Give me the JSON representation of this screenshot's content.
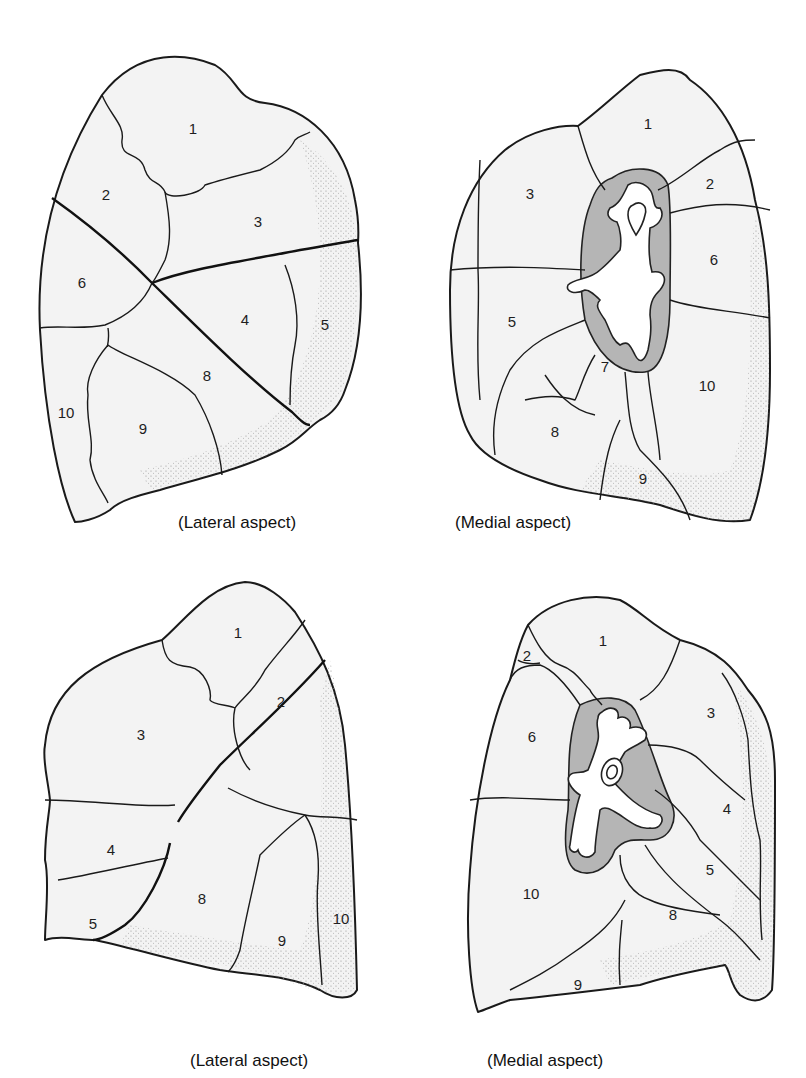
{
  "figure": {
    "panels": [
      {
        "id": "right-lateral",
        "caption": "(Lateral aspect)",
        "segments": [
          "1",
          "2",
          "3",
          "4",
          "5",
          "6",
          "8",
          "9",
          "10"
        ]
      },
      {
        "id": "right-medial",
        "caption": "(Medial aspect)",
        "segments": [
          "1",
          "2",
          "3",
          "5",
          "6",
          "7",
          "8",
          "9",
          "10"
        ]
      },
      {
        "id": "left-lateral",
        "caption": "(Lateral aspect)",
        "segments": [
          "1",
          "2",
          "3",
          "4",
          "5",
          "8",
          "9",
          "10"
        ]
      },
      {
        "id": "left-medial",
        "caption": "(Medial aspect)",
        "segments": [
          "1",
          "2",
          "3",
          "4",
          "5",
          "6",
          "8",
          "9",
          "10"
        ]
      }
    ]
  },
  "colors": {
    "lung_fill": "#f3f3f3",
    "hilum_fill": "#b5b5b5",
    "line": "#1a1a1a"
  }
}
